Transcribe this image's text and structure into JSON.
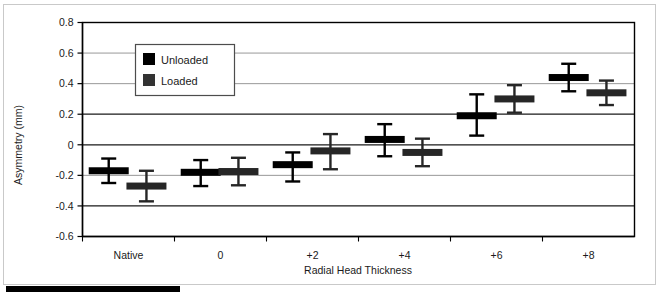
{
  "chart_data": {
    "type": "scatter",
    "title": "",
    "xlabel": "Radial Head Thickness",
    "ylabel": "Asymmetry (mm)",
    "categories": [
      "Native",
      "0",
      "+2",
      "+4",
      "+6",
      "+8"
    ],
    "ylim": [
      -0.6,
      0.8
    ],
    "yticks": [
      0.8,
      0.6,
      0.4,
      0.2,
      0,
      -0.2,
      -0.4,
      -0.6
    ],
    "ytick_labels": [
      "0.8",
      "0.6",
      "0.4",
      "0.2",
      "0",
      "-0.2",
      "-0.4",
      "-0.6"
    ],
    "grid": "horizontal",
    "legend_position": "upper-left-inside",
    "marker_style": "horizontal-bar-with-error-bars",
    "series": [
      {
        "name": "Unloaded",
        "color": "#000000",
        "values": [
          -0.17,
          -0.18,
          -0.13,
          0.035,
          0.19,
          0.44
        ],
        "err_upper": [
          0.08,
          0.08,
          0.08,
          0.1,
          0.14,
          0.09
        ],
        "err_lower": [
          0.08,
          0.09,
          0.11,
          0.11,
          0.13,
          0.09
        ]
      },
      {
        "name": "Loaded",
        "color": "#262626",
        "values": [
          -0.27,
          -0.175,
          -0.04,
          -0.05,
          0.3,
          0.34
        ],
        "err_upper": [
          0.1,
          0.09,
          0.11,
          0.09,
          0.09,
          0.08
        ],
        "err_lower": [
          0.1,
          0.09,
          0.12,
          0.09,
          0.09,
          0.08
        ]
      }
    ]
  },
  "legend": {
    "entries": [
      {
        "label": "Unloaded",
        "swatch": "#000000"
      },
      {
        "label": "Loaded",
        "swatch": "#333333"
      }
    ]
  },
  "axes": {
    "y_title": "Asymmetry (mm)",
    "x_title": "Radial Head Thickness"
  }
}
